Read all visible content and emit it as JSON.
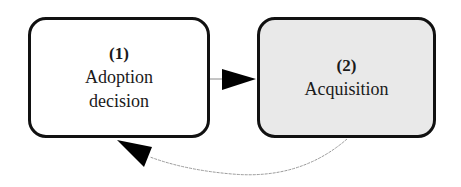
{
  "diagram": {
    "nodes": [
      {
        "id": "1",
        "number": "(1)",
        "label_lines": [
          "Adoption",
          "decision"
        ],
        "fill": "#ffffff"
      },
      {
        "id": "2",
        "number": "(2)",
        "label_lines": [
          "Acquisition"
        ],
        "fill": "#e9e9e9"
      }
    ],
    "edges": [
      {
        "from": "1",
        "to": "2",
        "style": "solid-thin",
        "arrow": "filled-triangle"
      },
      {
        "from": "2",
        "to": "1",
        "style": "dashed-curve",
        "arrow": "filled-triangle"
      }
    ],
    "colors": {
      "stroke": "#111111",
      "edge": "#9a9a9a",
      "arrow": "#000000"
    }
  }
}
